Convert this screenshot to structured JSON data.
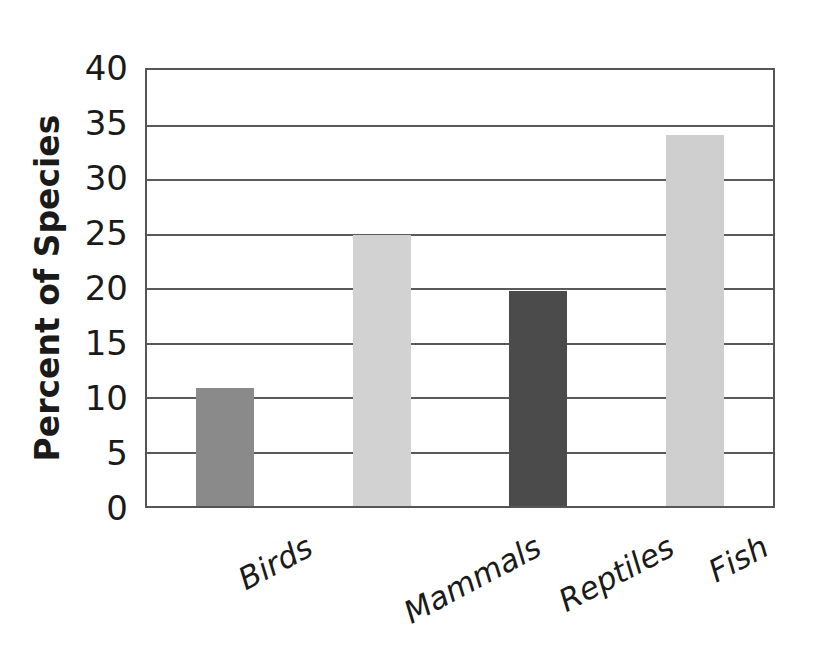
{
  "chart_data": {
    "type": "bar",
    "title": "",
    "subtitle": "",
    "xlabel": "",
    "ylabel": "Percent of Species",
    "categories": [
      "Birds",
      "Mammals",
      "Reptiles",
      "Fish"
    ],
    "values": [
      10.8,
      24.9,
      19.7,
      34.0
    ],
    "series": [
      {
        "name": "Percent of Species",
        "values": [
          10.8,
          24.9,
          19.7,
          34.0
        ]
      }
    ],
    "bar_colors": [
      "#8a8a8a",
      "#d2d2d2",
      "#4b4b4b",
      "#cfcfcf"
    ],
    "ylim": [
      0,
      40
    ],
    "ytick_step": 5,
    "ytick_labels": [
      "40",
      "35",
      "30",
      "25",
      "20",
      "15",
      "10",
      "5",
      "0"
    ],
    "ytick_values": [
      40,
      35,
      30,
      25,
      20,
      15,
      10,
      5,
      0
    ],
    "grid": "horizontal",
    "gridline_values": [
      35,
      30,
      25,
      20,
      15,
      10,
      5
    ],
    "legend": "none",
    "legend_position": "none",
    "plot_background": "#ffffff",
    "frame_color": "#555555",
    "gridline_color": "#5a5a5a",
    "text_color": "#1a1a1a",
    "xtick_rotation_degrees": -28,
    "annotations": []
  },
  "figure": {
    "background": "#ffffff"
  }
}
